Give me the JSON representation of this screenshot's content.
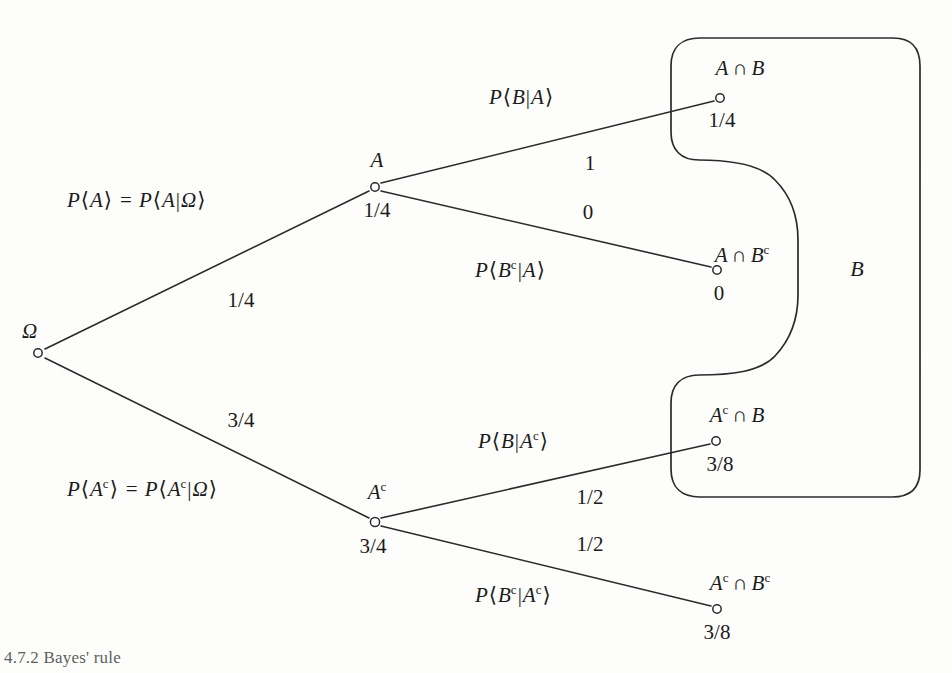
{
  "diagram": {
    "type": "probability-tree",
    "root": {
      "name": "root-node",
      "label": "Ω",
      "x": 38,
      "y": 353
    },
    "nodes": [
      {
        "id": "A",
        "label": "A",
        "value": "1/4",
        "x": 375,
        "y": 187
      },
      {
        "id": "Ac",
        "label": "Aᶜ",
        "value": "3/4",
        "x": 375,
        "y": 522
      },
      {
        "id": "AB",
        "label": "A ∩ B",
        "value": "1/4",
        "x": 720,
        "y": 98
      },
      {
        "id": "ABc",
        "label": "A ∩ Bᶜ",
        "value": "0",
        "x": 717,
        "y": 270
      },
      {
        "id": "AcB",
        "label": "Aᶜ ∩ B",
        "value": "3/8",
        "x": 716,
        "y": 441
      },
      {
        "id": "AcBc",
        "label": "Aᶜ ∩ Bᶜ",
        "value": "3/8",
        "x": 717,
        "y": 609
      }
    ],
    "branches": [
      {
        "id": "root-to-A",
        "expr": "P⟨A⟩ = P⟨A|Ω⟩",
        "weight": "1/4"
      },
      {
        "id": "root-to-Ac",
        "expr": "P⟨Aᶜ⟩ = P⟨Aᶜ|Ω⟩",
        "weight": "3/4"
      },
      {
        "id": "A-to-AB",
        "expr": "P⟨B|A⟩",
        "weight": "1"
      },
      {
        "id": "A-to-ABc",
        "expr": "P⟨Bᶜ|A⟩",
        "weight": "0"
      },
      {
        "id": "Ac-to-AcB",
        "expr": "P⟨B|Aᶜ⟩",
        "weight": "1/2"
      },
      {
        "id": "Ac-to-AcBc",
        "expr": "P⟨Bᶜ|Aᶜ⟩",
        "weight": "1/2"
      }
    ],
    "region": {
      "id": "B-region",
      "label": "B",
      "x": 855,
      "y": 270
    },
    "labels": {
      "omega": "Ω",
      "A": "A",
      "A_value": "1/4",
      "Ac_base": "A",
      "Ac_sup": "c",
      "Ac_value": "3/4",
      "branch_root_A_P": "P",
      "branch_root_A_open": "⟨",
      "branch_root_A_arg": "A",
      "branch_root_A_close": "⟩",
      "branch_root_A_eq": "=",
      "branch_root_A_cond": "|",
      "branch_root_A_given": "Ω",
      "weight_root_A": "1/4",
      "weight_root_Ac": "3/4",
      "weight_A_B": "1",
      "weight_A_Bc": "0",
      "weight_Ac_B": "1/2",
      "weight_Ac_Bc": "1/2",
      "out_AB_value": "1/4",
      "out_ABc_value": "0",
      "out_AcB_value": "3/8",
      "out_AcBc_value": "3/8",
      "intersect": "∩",
      "B": "B",
      "region_B": "B"
    },
    "colors": {
      "stroke": "#2b2b2b",
      "text": "#1b1b1b",
      "background": "#fdfdfc"
    }
  },
  "caption": {
    "text": "4.7.2  Bayes' rule"
  }
}
